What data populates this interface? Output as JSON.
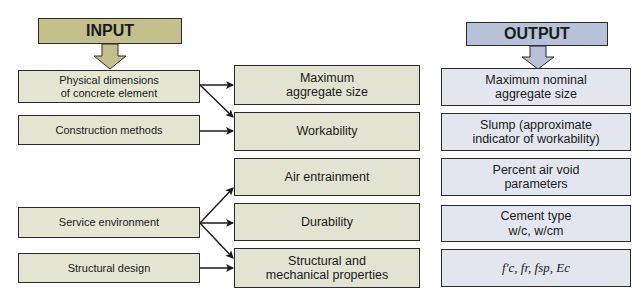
{
  "diagram": {
    "input_header": "INPUT",
    "output_header": "OUTPUT",
    "colors": {
      "input_header": "#c3c08c",
      "input_box": "#e4e6d2",
      "output_header": "#b7c2d9",
      "output_box": "#e3e6ee",
      "border": "#2a2a2a"
    },
    "inputs": [
      {
        "label": "Physical dimensions\nof concrete element"
      },
      {
        "label": "Construction methods"
      },
      {
        "label": "Service environment"
      },
      {
        "label": "Structural design"
      }
    ],
    "factors": [
      {
        "label": "Maximum\naggregate size"
      },
      {
        "label": "Workability"
      },
      {
        "label": "Air entrainment"
      },
      {
        "label": "Durability"
      },
      {
        "label": "Structural and\nmechanical properties"
      }
    ],
    "outputs": [
      {
        "label": "Maximum nominal\naggregate size"
      },
      {
        "label": "Slump (approximate\nindicator of workability)"
      },
      {
        "label": "Percent air void\nparameters"
      },
      {
        "label": "Cement type\nw/c, w/cm"
      },
      {
        "label": "f′c, fr, fsp, Ec"
      }
    ],
    "connections": [
      {
        "from": "Physical dimensions of concrete element",
        "to": "Maximum aggregate size"
      },
      {
        "from": "Physical dimensions of concrete element",
        "to": "Workability"
      },
      {
        "from": "Construction methods",
        "to": "Workability"
      },
      {
        "from": "Service environment",
        "to": "Air entrainment"
      },
      {
        "from": "Service environment",
        "to": "Durability"
      },
      {
        "from": "Service environment",
        "to": "Structural and mechanical properties"
      },
      {
        "from": "Structural design",
        "to": "Structural and mechanical properties"
      }
    ]
  }
}
